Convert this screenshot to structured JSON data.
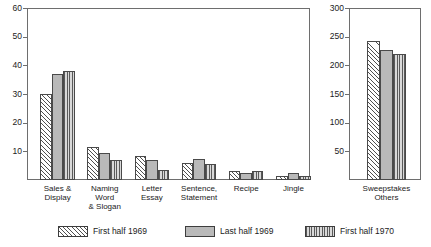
{
  "chart_data": [
    {
      "id": "main-panel",
      "type": "bar",
      "title": "",
      "xlabel": "",
      "ylabel": "",
      "ylim": [
        0,
        60
      ],
      "yticks": [
        10,
        20,
        30,
        40,
        50,
        60
      ],
      "grid": false,
      "legend_position": "bottom",
      "categories": [
        "Sales &\nDisplay",
        "Naming\nWord\n& Slogan",
        "Letter\nEssay",
        "Sentence,\nStatement",
        "Recipe",
        "Jingle"
      ],
      "series": [
        {
          "name": "First half 1969",
          "pattern": "diagonal-hatch",
          "values": [
            30,
            11.5,
            8.5,
            6,
            3,
            1.5
          ]
        },
        {
          "name": "Last half 1969",
          "pattern": "solid-gray",
          "values": [
            37,
            9.5,
            7,
            7.5,
            2.5,
            2.5
          ]
        },
        {
          "name": "First half 1970",
          "pattern": "vertical-stripe",
          "values": [
            38,
            7,
            3.5,
            5.5,
            3,
            1.5
          ]
        }
      ]
    },
    {
      "id": "side-panel",
      "type": "bar",
      "title": "",
      "xlabel": "",
      "ylabel": "",
      "ylim": [
        0,
        300
      ],
      "yticks": [
        50,
        100,
        150,
        200,
        250,
        300
      ],
      "grid": false,
      "legend_position": "bottom",
      "categories": [
        "Sweepstakes\nOthers"
      ],
      "series": [
        {
          "name": "First half 1969",
          "pattern": "diagonal-hatch",
          "values": [
            242
          ]
        },
        {
          "name": "Last half 1969",
          "pattern": "solid-gray",
          "values": [
            227
          ]
        },
        {
          "name": "First half 1970",
          "pattern": "vertical-stripe",
          "values": [
            220
          ]
        }
      ]
    }
  ],
  "legend": {
    "items": [
      {
        "label": "First half 1969",
        "pattern": "diagonal-hatch"
      },
      {
        "label": "Last half 1969",
        "pattern": "solid-gray"
      },
      {
        "label": "First half 1970",
        "pattern": "vertical-stripe"
      }
    ]
  },
  "colors": {
    "axis": "#6e6e6e",
    "bar_outline": "#4a4a4a",
    "solid_fill": "#b9b9b9",
    "hatch_line": "#4f4f4f",
    "text": "#1b1b1b",
    "background": "#ffffff"
  }
}
